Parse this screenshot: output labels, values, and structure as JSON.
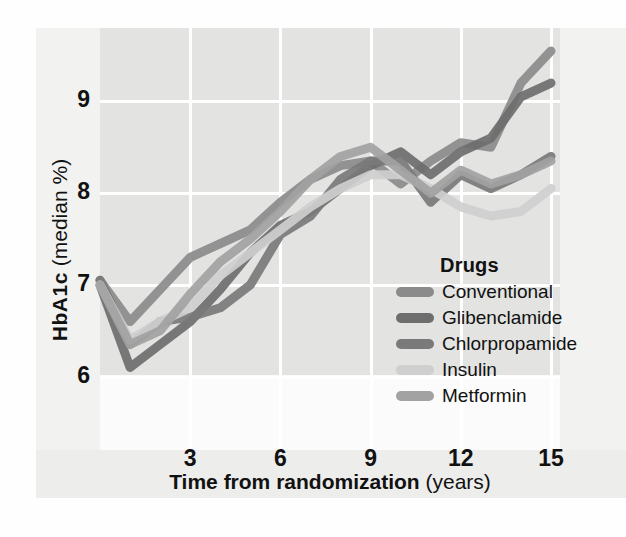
{
  "chart_data": {
    "type": "line",
    "title": "",
    "xlabel": "Time from randomization (years)",
    "xlabel_bold": "Time from randomization",
    "xlabel_unit": "(years)",
    "ylabel": "HbA1c (median %)",
    "ylabel_bold": "HbA1c",
    "ylabel_unit": "(median %)",
    "xlim": [
      0,
      15.3
    ],
    "ylim": [
      5.2,
      9.8
    ],
    "xticks": [
      3,
      6,
      9,
      12,
      15
    ],
    "yticks": [
      6,
      7,
      8,
      9
    ],
    "grid": true,
    "legend_position": "inside-lower-right",
    "legend_title": "Drugs",
    "x": [
      0,
      1,
      2,
      3,
      4,
      5,
      6,
      7,
      8,
      9,
      10,
      11,
      12,
      13,
      14,
      15
    ],
    "series": [
      {
        "name": "Conventional",
        "color": "#8b8b8b",
        "values": [
          7.05,
          6.6,
          6.95,
          7.3,
          7.45,
          7.6,
          7.9,
          8.15,
          8.3,
          8.35,
          8.1,
          8.35,
          8.55,
          8.5,
          9.2,
          9.55
        ]
      },
      {
        "name": "Glibenclamide",
        "color": "#6e6e6e",
        "values": [
          7.0,
          6.1,
          6.35,
          6.6,
          6.95,
          7.35,
          7.65,
          7.8,
          8.05,
          8.3,
          8.45,
          8.2,
          8.45,
          8.6,
          9.05,
          9.2
        ]
      },
      {
        "name": "Chlorpropamide",
        "color": "#7a7a7a",
        "values": [
          7.05,
          6.35,
          6.6,
          6.65,
          6.75,
          7.0,
          7.55,
          7.75,
          8.15,
          8.35,
          8.35,
          7.9,
          8.2,
          8.05,
          8.2,
          8.4
        ]
      },
      {
        "name": "Insulin",
        "color": "#cfcfcf",
        "values": [
          7.0,
          6.4,
          6.6,
          6.75,
          7.1,
          7.35,
          7.6,
          7.85,
          8.05,
          8.2,
          8.2,
          8.05,
          7.85,
          7.75,
          7.8,
          8.05
        ]
      },
      {
        "name": "Metformin",
        "color": "#a2a2a2",
        "values": [
          7.0,
          6.35,
          6.5,
          6.9,
          7.25,
          7.5,
          7.8,
          8.15,
          8.4,
          8.5,
          8.25,
          8.0,
          8.25,
          8.1,
          8.2,
          8.35
        ]
      }
    ]
  },
  "axes": {
    "yticks": [
      "6",
      "7",
      "8",
      "9"
    ],
    "xticks": [
      "3",
      "6",
      "9",
      "12",
      "15"
    ]
  },
  "legend": {
    "title": "Drugs",
    "items": [
      {
        "label": "Conventional",
        "color": "#8b8b8b"
      },
      {
        "label": "Glibenclamide",
        "color": "#6e6e6e"
      },
      {
        "label": "Chlorpropamide",
        "color": "#7a7a7a"
      },
      {
        "label": "Insulin",
        "color": "#cfcfcf"
      },
      {
        "label": "Metformin",
        "color": "#a2a2a2"
      }
    ]
  }
}
